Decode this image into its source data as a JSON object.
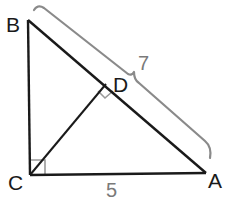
{
  "diagram": {
    "vertices": {
      "B": {
        "label": "B",
        "x": 28,
        "y": 20
      },
      "C": {
        "label": "C",
        "x": 30,
        "y": 175
      },
      "A": {
        "label": "A",
        "x": 206,
        "y": 173
      },
      "D": {
        "label": "D",
        "x": 106,
        "y": 84
      }
    },
    "segments": [
      {
        "from": "B",
        "to": "C"
      },
      {
        "from": "C",
        "to": "A"
      },
      {
        "from": "B",
        "to": "A"
      },
      {
        "from": "C",
        "to": "D"
      }
    ],
    "right_angles": [
      "C",
      "D"
    ],
    "measures": {
      "BA": {
        "label": "7",
        "style": "brace"
      },
      "CA": {
        "label": "5"
      }
    },
    "colors": {
      "line": "#1a1a1a",
      "brace": "#8a8a8a",
      "right_angle_mark": "#9a9a9a",
      "measure_text": "#7a7a7a"
    }
  }
}
